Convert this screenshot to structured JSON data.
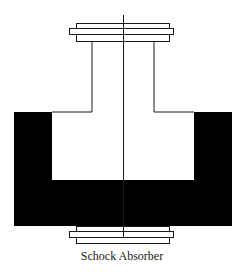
{
  "diagram": {
    "caption": "Schock Absorber",
    "colors": {
      "line": "#1a1a1a",
      "fill_body": "#000000",
      "background": "#ffffff"
    },
    "components": [
      "top-cap-plates",
      "piston-rod-stem",
      "center-axis-line",
      "u-shaped-cylinder-body",
      "bottom-cap-plates"
    ]
  }
}
